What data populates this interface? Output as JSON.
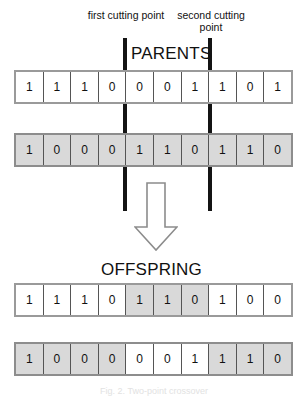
{
  "annotations": {
    "first_cut_label": "first cutting point",
    "second_cut_label": "second cutting point"
  },
  "sections": {
    "parents_title": "PARENTS",
    "offspring_title": "OFFSPRING"
  },
  "caption": "Fig. 2. Two-point crossover",
  "colors": {
    "shaded_cell": "#d9d9d9",
    "white_cell": "#ffffff",
    "cut_line": "#141414",
    "cell_border": "#555555",
    "row_border": "#9a9a9a"
  },
  "crossover": {
    "first_cut_index": 4,
    "second_cut_index": 7,
    "length": 10
  },
  "chromosomes": {
    "parent_1": {
      "name": "parent-1",
      "bits": [
        "1",
        "1",
        "1",
        "0",
        "0",
        "0",
        "1",
        "1",
        "0",
        "1"
      ],
      "shading": [
        "white",
        "white",
        "white",
        "white",
        "white",
        "white",
        "white",
        "white",
        "white",
        "white"
      ]
    },
    "parent_2": {
      "name": "parent-2",
      "bits": [
        "1",
        "0",
        "0",
        "0",
        "1",
        "1",
        "0",
        "1",
        "1",
        "0"
      ],
      "shading": [
        "gray",
        "gray",
        "gray",
        "gray",
        "gray",
        "gray",
        "gray",
        "gray",
        "gray",
        "gray"
      ]
    },
    "offspring_1": {
      "name": "offspring-1",
      "bits": [
        "1",
        "1",
        "1",
        "0",
        "1",
        "1",
        "0",
        "1",
        "0",
        "0"
      ],
      "shading": [
        "white",
        "white",
        "white",
        "white",
        "gray",
        "gray",
        "gray",
        "white",
        "white",
        "white"
      ]
    },
    "offspring_2": {
      "name": "offspring-2",
      "bits": [
        "1",
        "0",
        "0",
        "0",
        "0",
        "0",
        "1",
        "1",
        "1",
        "0"
      ],
      "shading": [
        "gray",
        "gray",
        "gray",
        "gray",
        "white",
        "white",
        "white",
        "gray",
        "gray",
        "gray"
      ]
    }
  }
}
